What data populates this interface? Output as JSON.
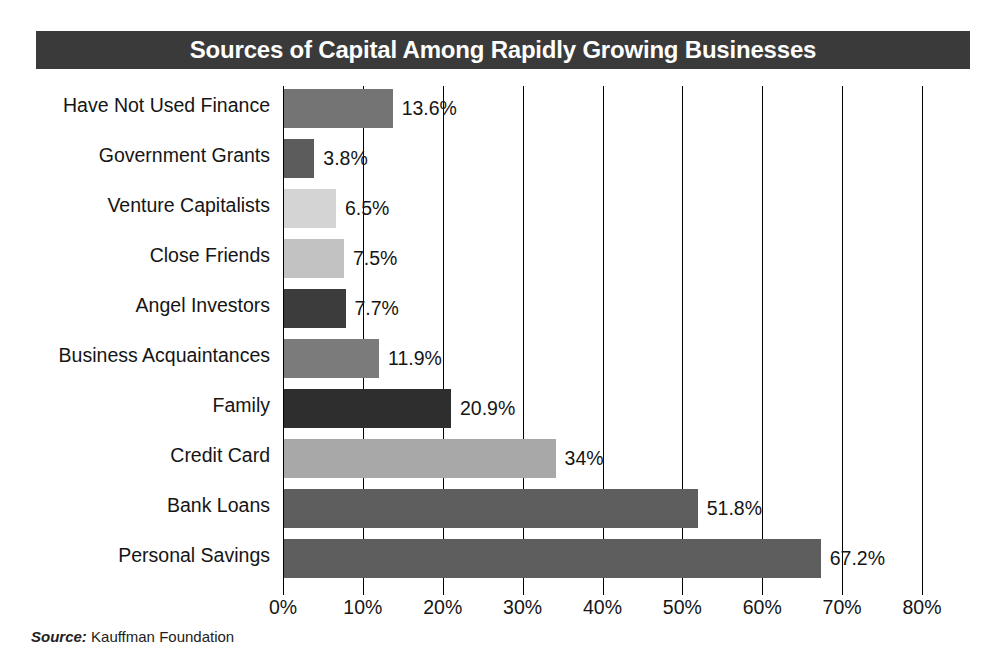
{
  "title": "Sources of Capital Among Rapidly Growing Businesses",
  "source": {
    "label": "Source:",
    "value": "Kauffman Foundation"
  },
  "theme": {
    "title_bar_bg": "#3a3a3a",
    "title_text_color": "#ffffff",
    "axis_color": "#000000",
    "page_bg": "#ffffff",
    "text_color": "#151515"
  },
  "chart_data": {
    "type": "bar",
    "orientation": "horizontal",
    "title": "Sources of Capital Among Rapidly Growing Businesses",
    "xlabel": "",
    "ylabel": "",
    "xlim": [
      0,
      80
    ],
    "xtick_step": 10,
    "grid": true,
    "legend": "none",
    "tick_labels": [
      "0%",
      "10%",
      "20%",
      "30%",
      "40%",
      "50%",
      "60%",
      "70%",
      "80%"
    ],
    "tick_values": [
      0,
      10,
      20,
      30,
      40,
      50,
      60,
      70,
      80
    ],
    "categories": [
      "Have Not Used Finance",
      "Government Grants",
      "Venture Capitalists",
      "Close Friends",
      "Angel Investors",
      "Business Acquaintances",
      "Family",
      "Credit Card",
      "Bank Loans",
      "Personal Savings"
    ],
    "values": [
      13.6,
      3.8,
      6.5,
      7.5,
      7.7,
      11.9,
      20.9,
      34,
      51.8,
      67.2
    ],
    "value_labels": [
      "13.6%",
      "3.8%",
      "6.5%",
      "7.5%",
      "7.7%",
      "11.9%",
      "20.9%",
      "34%",
      "51.8%",
      "67.2%"
    ],
    "bar_colors": [
      "#747474",
      "#5c5c5c",
      "#d4d4d4",
      "#c2c2c2",
      "#3c3c3c",
      "#7b7b7b",
      "#2e2e2e",
      "#a8a8a8",
      "#5e5e5e",
      "#5e5e5e"
    ]
  }
}
